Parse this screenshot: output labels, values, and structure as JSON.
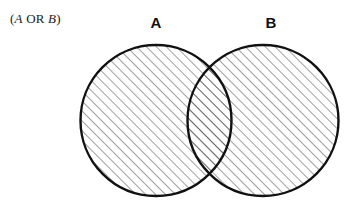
{
  "figure": {
    "background_color": "#ffffff",
    "width": 354,
    "height": 213,
    "caption": {
      "full_text": "(A OR B)",
      "open_paren": "(",
      "left_operand": "A",
      "operator": " OR ",
      "right_operand": "B",
      "close_paren": ")"
    },
    "labels": {
      "left_circle": "A",
      "right_circle": "B"
    },
    "style": {
      "outline_color": "#111111",
      "outline_width": 2.4,
      "hatch_color": "#2b2b2b",
      "hatch_width": 0.9,
      "hatch_spacing": 7,
      "hatch_angle_deg": 45,
      "fill_color": "#ffffff"
    },
    "geometry": {
      "left_circle": {
        "cx": 156,
        "cy": 120.5,
        "r": 75.5
      },
      "right_circle": {
        "cx": 263,
        "cy": 120.5,
        "r": 75.5
      }
    },
    "shaded_region": "union",
    "shaded_region_description": "Both circles entirely shaded, representing A OR B"
  }
}
